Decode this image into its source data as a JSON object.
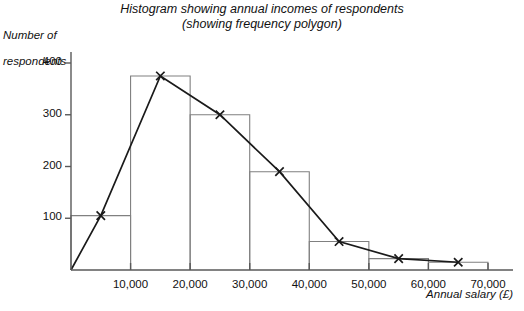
{
  "chart_data": {
    "type": "bar",
    "title": "Histogram showing annual incomes of respondents",
    "subtitle": "(showing frequency polygon)",
    "xlabel": "Annual salary (£)",
    "ylabel": "Number of\nrespondents",
    "xlabel_line1": "Annual salary (£)",
    "ylabel_line1": "Number of",
    "ylabel_line2": "respondents",
    "grid": false,
    "legend": "none",
    "xlim": [
      0,
      70000
    ],
    "ylim": [
      0,
      420
    ],
    "bin_width": 10000,
    "bin_edges": [
      0,
      10000,
      20000,
      30000,
      40000,
      50000,
      60000,
      70000
    ],
    "categories": [
      "0–10,000",
      "10,000–20,000",
      "20,000–30,000",
      "30,000–40,000",
      "40,000–50,000",
      "50,000–60,000",
      "60,000–70,000"
    ],
    "values": [
      105,
      375,
      300,
      190,
      55,
      22,
      15
    ],
    "xticks": [
      10000,
      20000,
      30000,
      40000,
      50000,
      60000,
      70000
    ],
    "xtick_labels": [
      "10,000",
      "20,000",
      "30,000",
      "40,000",
      "50,000",
      "60,000",
      "70,000"
    ],
    "yticks": [
      100,
      200,
      300,
      400
    ],
    "ytick_labels": [
      "100",
      "200",
      "300",
      "400"
    ],
    "overlay": {
      "type": "line",
      "name": "frequency polygon",
      "marker": "x",
      "x": [
        0,
        5000,
        15000,
        25000,
        35000,
        45000,
        55000,
        65000
      ],
      "y": [
        0,
        105,
        375,
        300,
        190,
        55,
        22,
        15
      ],
      "marker_x": [
        5000,
        15000,
        25000,
        35000,
        45000,
        55000,
        65000
      ],
      "marker_y": [
        105,
        375,
        300,
        190,
        55,
        22,
        15
      ]
    },
    "colors": {
      "bar_stroke": "#808080",
      "axis": "#595959",
      "polygon": "#1a1a1a",
      "background": "#ffffff"
    }
  }
}
